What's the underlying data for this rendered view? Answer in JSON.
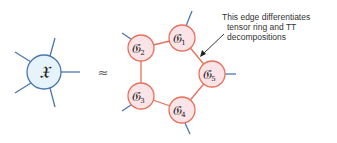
{
  "diagram": {
    "colors": {
      "x_fill": "#e6f3fa",
      "x_stroke": "#4a78ad",
      "leg_stroke": "#4a78ad",
      "core_fill": "#fbe4e8",
      "core_stroke": "#e8705a",
      "bond_stroke": "#e8705a",
      "arrow": "#222222"
    },
    "full_tensor": {
      "label": "𝔛"
    },
    "approx_symbol": "≈",
    "cores": [
      {
        "id": "g1",
        "label": "𝔊",
        "sub": "1"
      },
      {
        "id": "g2",
        "label": "𝔊",
        "sub": "2"
      },
      {
        "id": "g3",
        "label": "𝔊",
        "sub": "3"
      },
      {
        "id": "g4",
        "label": "𝔊",
        "sub": "4"
      },
      {
        "id": "g5",
        "label": "𝔊",
        "sub": "5"
      }
    ],
    "annotation": {
      "lines": [
        "This edge differentiates",
        "tensor ring and TT",
        "decompositions"
      ]
    }
  }
}
